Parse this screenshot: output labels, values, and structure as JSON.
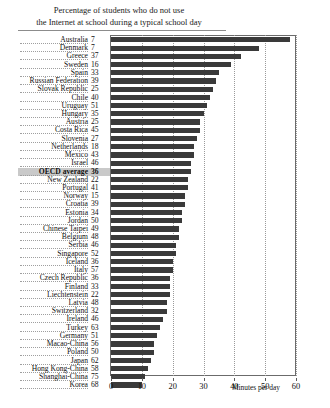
{
  "title": {
    "line1": "Percentage of students who do not use",
    "line2": "the Internet at school during a typical school day"
  },
  "axis": {
    "title": "Minutes per day",
    "ticks": [
      "0",
      "10",
      "20",
      "30",
      "40",
      "50",
      "60"
    ]
  },
  "chart_data": {
    "type": "bar",
    "orientation": "horizontal",
    "title": "Percentage of students who do not use the Internet at school during a typical school day",
    "xlabel": "Minutes per day",
    "ylabel": "",
    "xlim": [
      0,
      60
    ],
    "grid": true,
    "legend": false,
    "value_column_label": "Percentage of students who do not use the Internet at school during a typical school day",
    "categories": [
      "Australia",
      "Denmark",
      "Greece",
      "Sweden",
      "Spain",
      "Russian Federation",
      "Slovak Republic",
      "Chile",
      "Uruguay",
      "Hungary",
      "Austria",
      "Costa Rica",
      "Slovenia",
      "Netherlands",
      "Mexico",
      "Israel",
      "OECD average",
      "New Zealand",
      "Portugal",
      "Norway",
      "Croatia",
      "Estonia",
      "Jordan",
      "Chinese Taipei",
      "Belgium",
      "Serbia",
      "Singapore",
      "Iceland",
      "Italy",
      "Czech Republic",
      "Finland",
      "Liechtenstein",
      "Latvia",
      "Switzerland",
      "Ireland",
      "Turkey",
      "Germany",
      "Macao-China",
      "Poland",
      "Japan",
      "Hong Kong-China",
      "Shanghai-China",
      "Korea"
    ],
    "values": [
      58,
      48,
      42,
      39,
      35,
      34,
      33,
      32,
      31,
      30,
      29,
      29,
      28,
      27,
      27,
      26,
      26,
      25,
      25,
      24,
      24,
      23,
      23,
      22,
      22,
      21,
      21,
      20,
      20,
      19,
      19,
      19,
      18,
      18,
      17,
      16,
      15,
      14,
      14,
      13,
      12,
      11,
      10
    ],
    "percentages": [
      7,
      7,
      37,
      16,
      33,
      39,
      25,
      40,
      51,
      35,
      25,
      45,
      27,
      18,
      43,
      46,
      36,
      22,
      41,
      15,
      39,
      34,
      50,
      49,
      48,
      46,
      52,
      36,
      57,
      36,
      33,
      22,
      48,
      32,
      46,
      63,
      51,
      56,
      50,
      62,
      58,
      75,
      68
    ],
    "highlight_category": "OECD average",
    "bar_color": "#3a3a3a",
    "highlight_color": "#c9c9c9"
  }
}
